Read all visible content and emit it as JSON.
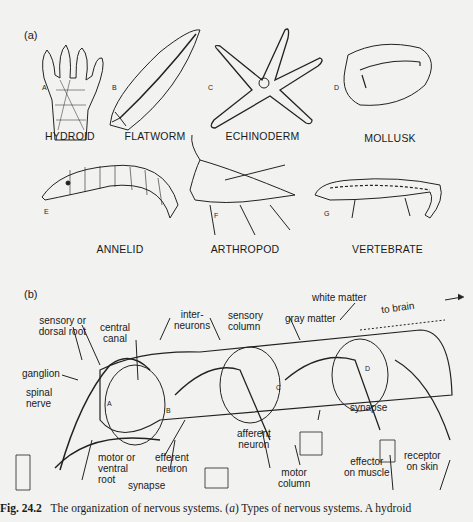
{
  "panel_a": {
    "label": "(a)",
    "animals": [
      {
        "letter": "A",
        "name": "HYDROID"
      },
      {
        "letter": "B",
        "name": "FLATWORM"
      },
      {
        "letter": "C",
        "name": "ECHINODERM"
      },
      {
        "letter": "D",
        "name": "MOLLUSK"
      },
      {
        "letter": "E",
        "name": "ANNELID"
      },
      {
        "letter": "F",
        "name": "ARTHROPOD"
      },
      {
        "letter": "G",
        "name": "VERTEBRATE"
      }
    ]
  },
  "panel_b": {
    "label": "(b)",
    "segment_letters": [
      "A",
      "B",
      "C",
      "D"
    ],
    "labels": {
      "sensory_root": [
        "sensory or",
        "dorsal root"
      ],
      "central_canal": [
        "central",
        "canal"
      ],
      "interneurons": [
        "inter-",
        "neurons"
      ],
      "sensory_column": [
        "sensory",
        "column"
      ],
      "gray_matter": "gray matter",
      "white_matter": "white matter",
      "to_brain": "to brain",
      "ganglion": "ganglion",
      "spinal_nerve": [
        "spinal",
        "nerve"
      ],
      "synapse_right": "synapse",
      "afferent_neuron": [
        "afferent",
        "neuron"
      ],
      "motor_root": [
        "motor or",
        "ventral",
        "root"
      ],
      "efferent_neuron": [
        "efferent",
        "neuron"
      ],
      "synapse_bottom": "synapse",
      "motor_column": [
        "motor",
        "column"
      ],
      "effector": [
        "effector",
        "on muscle"
      ],
      "receptor": [
        "receptor",
        "on skin"
      ]
    }
  },
  "caption": {
    "fig_number": "Fig. 24.2",
    "text_1": "The organization of nervous systems. (",
    "italic_a": "a",
    "text_2": ") Types of nervous systems. A hydroid"
  }
}
